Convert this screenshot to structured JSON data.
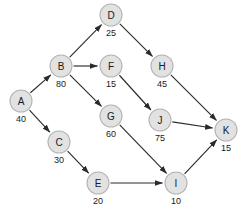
{
  "diagram": {
    "background_color": "#ffffff",
    "node_fill_color": "#e2e2e2",
    "node_stroke_color": "#b4b4b4",
    "edge_color": "#2b2b2b",
    "text_color": "#1a1a1a",
    "node_radius": 11,
    "nodes": [
      {
        "id": "A",
        "label": "A",
        "weight": "40",
        "x": 21,
        "y": 101
      },
      {
        "id": "B",
        "label": "B",
        "weight": "80",
        "x": 61,
        "y": 66
      },
      {
        "id": "C",
        "label": "C",
        "weight": "30",
        "x": 59,
        "y": 142
      },
      {
        "id": "D",
        "label": "D",
        "weight": "25",
        "x": 111,
        "y": 15
      },
      {
        "id": "E",
        "label": "E",
        "weight": "20",
        "x": 98,
        "y": 183
      },
      {
        "id": "F",
        "label": "F",
        "weight": "15",
        "x": 111,
        "y": 66
      },
      {
        "id": "G",
        "label": "G",
        "weight": "60",
        "x": 111,
        "y": 116
      },
      {
        "id": "H",
        "label": "H",
        "weight": "45",
        "x": 162,
        "y": 66
      },
      {
        "id": "I",
        "label": "I",
        "weight": "10",
        "x": 176,
        "y": 183
      },
      {
        "id": "J",
        "label": "J",
        "weight": "75",
        "x": 160,
        "y": 120
      },
      {
        "id": "K",
        "label": "K",
        "weight": "15",
        "x": 226,
        "y": 130
      }
    ],
    "edges": [
      {
        "from": "A",
        "to": "B"
      },
      {
        "from": "A",
        "to": "C"
      },
      {
        "from": "B",
        "to": "D"
      },
      {
        "from": "B",
        "to": "F"
      },
      {
        "from": "B",
        "to": "G"
      },
      {
        "from": "C",
        "to": "E"
      },
      {
        "from": "D",
        "to": "H"
      },
      {
        "from": "E",
        "to": "I"
      },
      {
        "from": "F",
        "to": "J"
      },
      {
        "from": "G",
        "to": "I"
      },
      {
        "from": "H",
        "to": "K"
      },
      {
        "from": "I",
        "to": "K"
      },
      {
        "from": "J",
        "to": "K"
      }
    ]
  }
}
